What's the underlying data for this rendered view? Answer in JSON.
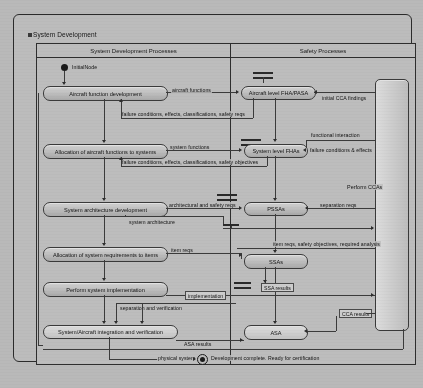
{
  "diagram": {
    "title": "System Development",
    "icon": "activity-diagram-icon",
    "lanes": [
      {
        "name": "System Development Processes"
      },
      {
        "name": "Safety Processes"
      }
    ],
    "nodes": {
      "initial_label": "InitialNode",
      "final_label": "Development complete. Ready for certification",
      "aircraft_function_development": "Aircraft function development",
      "allocation_aircraft_functions": "Allocation of aircraft functions to systems",
      "system_architecture_development": "System architecture development",
      "allocation_system_requirements": "Allocation of system requirements to items",
      "perform_system_implementation": "Perform system implementation",
      "system_aircraft_integration": "System/Aircraft integration and verification",
      "aircraft_level_fha": "Aircraft level FHA/PASA",
      "system_level_fha": "System level FHAs",
      "pssas": "PSSAs",
      "ssas": "SSAs",
      "asa": "ASA",
      "perform_ccas": "Perform CCAs"
    },
    "flows": {
      "aircraft_functions": "aircraft functions",
      "initial_cca_findings": "initial CCA findings",
      "failure_conditions_1": "failure conditions, effects, classifications, safety reqs",
      "functional_interaction": "functional interaction",
      "system_functions": "system functions",
      "failure_conditions_effects": "failure conditions & effects",
      "failure_conditions_2": "failure conditions, effects, classifications, safety objectives",
      "architectural_safety_reqs": "architectural and safety reqs",
      "separation_reqs_1": "separation reqs",
      "system_architecture": "system architecture",
      "item_reqs": "item reqs",
      "item_reqs_safety": "item reqs, safety objectives, required analysis",
      "implementation": "implementation",
      "ssa_results": "SSA results",
      "separation_and_verification": "separation and verification",
      "cca_results": "CCA results",
      "asa_results": "ASA results",
      "physical_system": "physical system"
    },
    "colors": {
      "paper": "#bdbdbd",
      "line": "#3b3b3b",
      "node_fill": "#d2d2d2",
      "text": "#141414"
    }
  }
}
